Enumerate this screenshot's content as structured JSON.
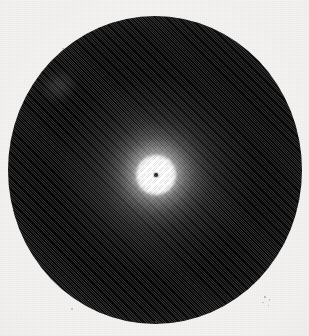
{
  "figure": {
    "kind": "photographic-plate",
    "caption": "",
    "label": "",
    "alt_text": "Circular photographic plate showing a bright central spot with a small dark beam-stop dot, a decaying bright halo, and a broad dark annulus fading to light at the rim."
  },
  "colors": {
    "paper": "#f4f3f1",
    "paper_edge": "#e6e4e0",
    "disc_dark": "#060606",
    "disc_mid": "#3d3d3d",
    "disc_rim": "#c2c2c0",
    "core_bright": "#ffffff",
    "beam_stop": "#2b2b2b"
  },
  "geometry": {
    "image_width": 309,
    "image_height": 336,
    "disc_center_x": 155,
    "disc_center_y": 175,
    "disc_radius_x": 147,
    "disc_radius_y": 154,
    "core_radius": 20,
    "beam_stop_radius": 2,
    "inner_halo_radius": 95
  },
  "chart_data": {
    "type": "heatmap",
    "title": "",
    "subtitle": "",
    "xlabel": "",
    "ylabel": "",
    "radial_profile": {
      "x": "radius in pixels from disc centre",
      "y": "relative luminance 0 (black) to 255 (white)",
      "radius_px": [
        0,
        2,
        5,
        10,
        14,
        18,
        24,
        32,
        42,
        55,
        70,
        85,
        100,
        115,
        125,
        132,
        138,
        143,
        147,
        152,
        158
      ],
      "luminance": [
        48,
        40,
        246,
        240,
        196,
        138,
        96,
        70,
        52,
        36,
        24,
        16,
        12,
        18,
        34,
        58,
        92,
        140,
        190,
        228,
        243
      ]
    },
    "annotations": [
      {
        "name": "bright-core",
        "radius_px": 0,
        "luminance": 250
      },
      {
        "name": "beam-stop-dot",
        "radius_px": 0,
        "luminance": 43
      },
      {
        "name": "halo-falloff",
        "radius_px": 45,
        "luminance": 50
      },
      {
        "name": "dark-annulus",
        "radius_px": 100,
        "luminance": 12
      },
      {
        "name": "outer-rim-falloff",
        "radius_px": 147,
        "luminance": 190
      },
      {
        "name": "paper-background",
        "radius_px": 158,
        "luminance": 243
      }
    ],
    "grid": false,
    "legend": "none"
  }
}
